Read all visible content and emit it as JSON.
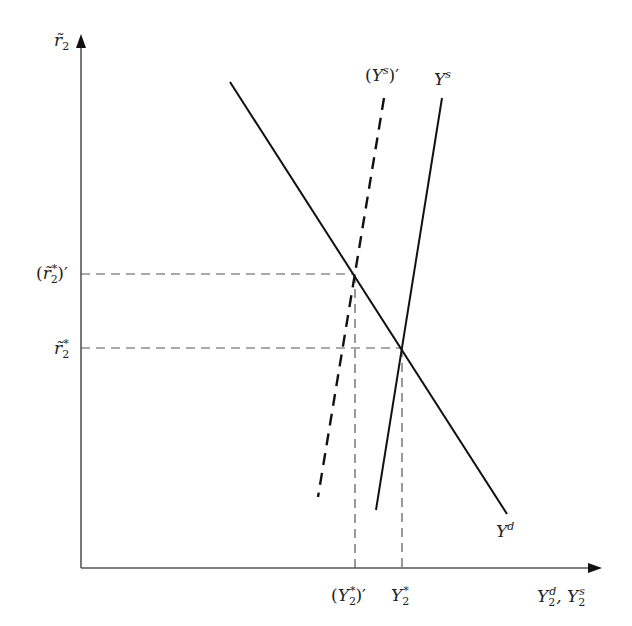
{
  "axes": {
    "y_label": "r̃₂",
    "x_label": "Y₂ᵈ, Y₂ˢ"
  },
  "curves": {
    "demand": {
      "label": "Yᵈ",
      "style": "solid"
    },
    "supply": {
      "label": "Yˢ",
      "style": "solid"
    },
    "supply_shifted": {
      "label": "(Yˢ)′",
      "style": "dashed"
    }
  },
  "y_ticks": [
    {
      "label": "(r̃₂*)′"
    },
    {
      "label": "r̃₂*"
    }
  ],
  "x_ticks": [
    {
      "label": "(Y₂*)′"
    },
    {
      "label": "Y₂*"
    }
  ]
}
